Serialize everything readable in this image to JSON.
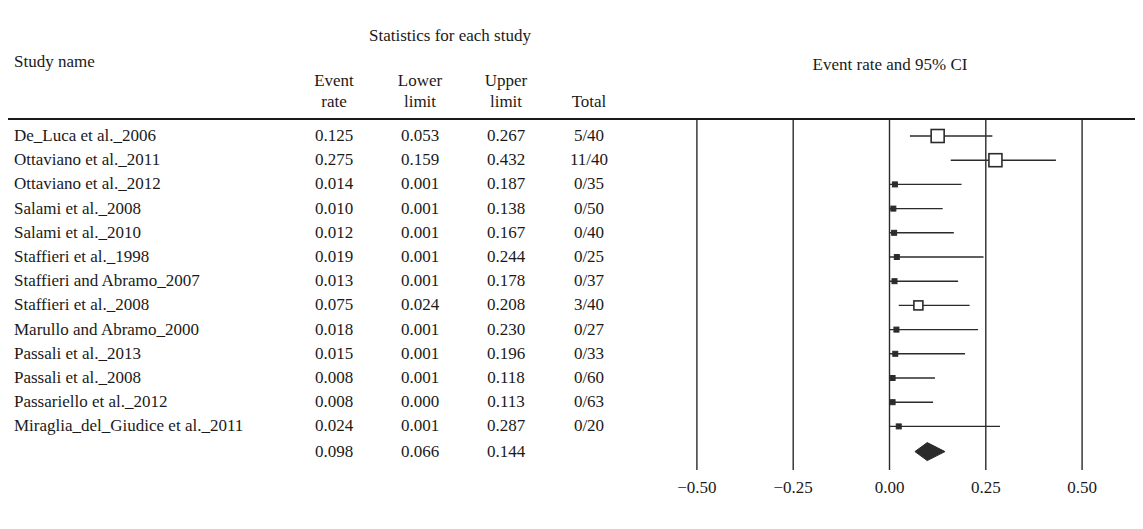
{
  "headers": {
    "stats_group_title": "Statistics for each study",
    "study_name": "Study name",
    "event_rate_l1": "Event",
    "event_rate_l2": "rate",
    "lower_limit_l1": "Lower",
    "lower_limit_l2": "limit",
    "upper_limit_l1": "Upper",
    "upper_limit_l2": "limit",
    "total": "Total",
    "plot_title": "Event rate and 95% CI"
  },
  "rows": [
    {
      "name": "De_Luca et al._2006",
      "event_rate": "0.125",
      "lower_limit": "0.053",
      "upper_limit": "0.267",
      "total": "5/40",
      "marker": "large"
    },
    {
      "name": "Ottaviano et al._2011",
      "event_rate": "0.275",
      "lower_limit": "0.159",
      "upper_limit": "0.432",
      "total": "11/40",
      "marker": "large"
    },
    {
      "name": "Ottaviano et al._2012",
      "event_rate": "0.014",
      "lower_limit": "0.001",
      "upper_limit": "0.187",
      "total": "0/35",
      "marker": "dot"
    },
    {
      "name": "Salami et al._2008",
      "event_rate": "0.010",
      "lower_limit": "0.001",
      "upper_limit": "0.138",
      "total": "0/50",
      "marker": "dot"
    },
    {
      "name": "Salami et al._2010",
      "event_rate": "0.012",
      "lower_limit": "0.001",
      "upper_limit": "0.167",
      "total": "0/40",
      "marker": "dot"
    },
    {
      "name": "Staffieri et al._1998",
      "event_rate": "0.019",
      "lower_limit": "0.001",
      "upper_limit": "0.244",
      "total": "0/25",
      "marker": "dot"
    },
    {
      "name": "Staffieri and Abramo_2007",
      "event_rate": "0.013",
      "lower_limit": "0.001",
      "upper_limit": "0.178",
      "total": "0/37",
      "marker": "dot"
    },
    {
      "name": "Staffieri et al._2008",
      "event_rate": "0.075",
      "lower_limit": "0.024",
      "upper_limit": "0.208",
      "total": "3/40",
      "marker": "small"
    },
    {
      "name": "Marullo and Abramo_2000",
      "event_rate": "0.018",
      "lower_limit": "0.001",
      "upper_limit": "0.230",
      "total": "0/27",
      "marker": "dot"
    },
    {
      "name": "Passali et al._2013",
      "event_rate": "0.015",
      "lower_limit": "0.001",
      "upper_limit": "0.196",
      "total": "0/33",
      "marker": "dot"
    },
    {
      "name": "Passali et al._2008",
      "event_rate": "0.008",
      "lower_limit": "0.001",
      "upper_limit": "0.118",
      "total": "0/60",
      "marker": "dot"
    },
    {
      "name": "Passariello et al._2012",
      "event_rate": "0.008",
      "lower_limit": "0.000",
      "upper_limit": "0.113",
      "total": "0/63",
      "marker": "dot"
    },
    {
      "name": "Miraglia_del_Giudice et al._2011",
      "event_rate": "0.024",
      "lower_limit": "0.001",
      "upper_limit": "0.287",
      "total": "0/20",
      "marker": "dot"
    }
  ],
  "summary": {
    "name": "",
    "event_rate": "0.098",
    "lower_limit": "0.066",
    "upper_limit": "0.144",
    "total": ""
  },
  "axis": {
    "ticks": [
      "−0.50",
      "−0.25",
      "0.00",
      "0.25",
      "0.50"
    ],
    "tick_values": [
      -0.5,
      -0.25,
      0,
      0.25,
      0.5
    ]
  },
  "colors": {
    "ink": "#1a1a1a",
    "line": "#2b2b2b",
    "marker_fill": "#ffffff"
  },
  "chart_data": {
    "type": "forest",
    "title": "Event rate and 95% CI",
    "xlabel": "",
    "ylabel": "",
    "xlim": [
      -0.5,
      0.5
    ],
    "xticks": [
      -0.5,
      -0.25,
      0,
      0.25,
      0.5
    ],
    "xticklabels": [
      "−0.50",
      "−0.25",
      "0.00",
      "0.25",
      "0.50"
    ],
    "grid": true,
    "legend": "none",
    "effect_measure": "Event rate",
    "confidence_level": "95%",
    "categories": [
      "De_Luca et al._2006",
      "Ottaviano et al._2011",
      "Ottaviano et al._2012",
      "Salami et al._2008",
      "Salami et al._2010",
      "Staffieri et al._1998",
      "Staffieri and Abramo_2007",
      "Staffieri et al._2008",
      "Marullo and Abramo_2000",
      "Passali et al._2013",
      "Passali et al._2008",
      "Passariello et al._2012",
      "Miraglia_del_Giudice et al._2011"
    ],
    "values": [
      0.125,
      0.275,
      0.014,
      0.01,
      0.012,
      0.019,
      0.013,
      0.075,
      0.018,
      0.015,
      0.008,
      0.008,
      0.024
    ],
    "ci_lower": [
      0.053,
      0.159,
      0.001,
      0.001,
      0.001,
      0.001,
      0.001,
      0.024,
      0.001,
      0.001,
      0.001,
      0.0,
      0.001
    ],
    "ci_upper": [
      0.267,
      0.432,
      0.187,
      0.138,
      0.167,
      0.244,
      0.178,
      0.208,
      0.23,
      0.196,
      0.118,
      0.113,
      0.287
    ],
    "events": [
      5,
      11,
      0,
      0,
      0,
      0,
      0,
      3,
      0,
      0,
      0,
      0,
      0
    ],
    "sample_sizes": [
      40,
      40,
      35,
      50,
      40,
      25,
      37,
      40,
      27,
      33,
      60,
      63,
      20
    ],
    "totals": [
      "5/40",
      "11/40",
      "0/35",
      "0/50",
      "0/40",
      "0/25",
      "0/37",
      "3/40",
      "0/27",
      "0/33",
      "0/60",
      "0/63",
      "0/20"
    ],
    "marker_sizes": [
      "large",
      "large",
      "dot",
      "dot",
      "dot",
      "dot",
      "dot",
      "small",
      "dot",
      "dot",
      "dot",
      "dot",
      "dot"
    ],
    "summary": {
      "label": "Overall",
      "value": 0.098,
      "ci_lower": 0.066,
      "ci_upper": 0.144,
      "shape": "diamond"
    }
  }
}
